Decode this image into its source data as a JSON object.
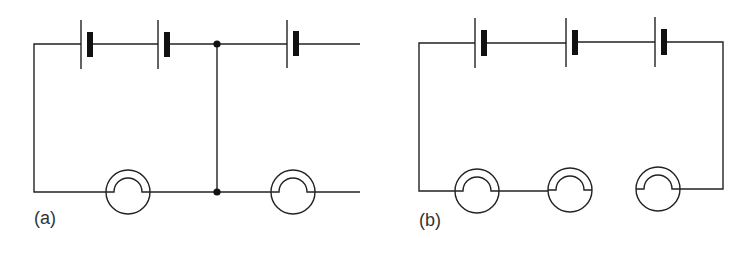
{
  "figure": {
    "panels": [
      {
        "id": "a",
        "label": "(a)",
        "cells": 3,
        "bulbs": 2,
        "junctions": 2,
        "description": "Two cells in series powering a bulb; a cross wire with junction nodes connects to a third cell and second bulb whose ends are left open"
      },
      {
        "id": "b",
        "label": "(b)",
        "cells": 3,
        "bulbs": 3,
        "junctions": 0,
        "description": "Three cells in series with three bulbs in a closed loop; gap shown between second and third bulb"
      }
    ]
  },
  "colors": {
    "line": "#222222",
    "fill": "#111111",
    "background": "#ffffff"
  }
}
